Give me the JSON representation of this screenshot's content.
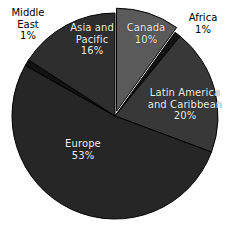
{
  "chart_data": {
    "type": "pie",
    "title": "",
    "subtitle": "",
    "xlabel": "",
    "ylabel": "",
    "legend_position": "none",
    "grid": false,
    "labels_format": "name + percent",
    "categories": [
      "Canada",
      "Africa",
      "Latin America and Caribbean",
      "Europe",
      "Middle East",
      "Asia and Pacific"
    ],
    "values": [
      10,
      1,
      20,
      53,
      1,
      16
    ],
    "start_angle_deg": 0,
    "direction": "clockwise",
    "slices": [
      {
        "name": "Canada",
        "value": 10,
        "percent_label": "10%",
        "label": "Canada",
        "label_placement": "inside",
        "label_color": "#f2f2f2",
        "color": "#5a5a5a",
        "exploded": true
      },
      {
        "name": "Africa",
        "value": 1,
        "percent_label": "1%",
        "label": "Africa",
        "label_placement": "outside",
        "label_color": "#000000",
        "color": "#141414",
        "exploded": false
      },
      {
        "name": "Latin America and Caribbean",
        "value": 20,
        "percent_label": "20%",
        "label": "Latin America and Caribbean",
        "label_placement": "inside",
        "label_color": "#f2f2f2",
        "color": "#383838",
        "exploded": false
      },
      {
        "name": "Europe",
        "value": 53,
        "percent_label": "53%",
        "label": "Europe",
        "label_placement": "inside",
        "label_color": "#f2f2f2",
        "color": "#262626",
        "exploded": false
      },
      {
        "name": "Middle East",
        "value": 1,
        "percent_label": "1%",
        "label": "Middle East",
        "label_placement": "outside",
        "label_color": "#000000",
        "color": "#131313",
        "exploded": false
      },
      {
        "name": "Asia and Pacific",
        "value": 16,
        "percent_label": "16%",
        "label": "Asia and Pacific",
        "label_placement": "inside",
        "label_color": "#f2f2f2",
        "color": "#2e2e2e",
        "exploded": false
      }
    ]
  },
  "labels": {
    "canada": "Canada\n10%",
    "africa": "Africa\n1%",
    "latin_america": "Latin America\nand Caribbean\n20%",
    "europe": "Europe\n53%",
    "middle_east": "Middle\nEast\n1%",
    "asia_pacific": "Asia and\nPacific\n16%"
  },
  "colors": {
    "background": "#ffffff",
    "canada": "#5a5a5a",
    "africa": "#141414",
    "latin_america": "#383838",
    "europe": "#262626",
    "middle_east": "#131313",
    "asia_pacific": "#2e2e2e",
    "inside_text": "#f2f2f2",
    "outside_text": "#000000",
    "slice_border": "#000000"
  }
}
